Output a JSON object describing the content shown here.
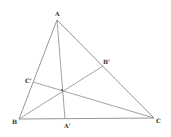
{
  "diagram": {
    "type": "triangle-cevians",
    "points": {
      "A": {
        "label": "A",
        "x": 57,
        "y": 20,
        "lx": 55,
        "ly": 16
      },
      "B": {
        "label": "B",
        "x": 19,
        "y": 119,
        "lx": 12,
        "ly": 124
      },
      "C": {
        "label": "C",
        "x": 154,
        "y": 118,
        "lx": 156,
        "ly": 123
      },
      "A1": {
        "label": "A'",
        "x": 65,
        "y": 119,
        "lx": 64,
        "ly": 128
      },
      "B1": {
        "label": "B'",
        "x": 103,
        "y": 66,
        "lx": 103,
        "ly": 64
      },
      "C1": {
        "label": "C'",
        "x": 33,
        "y": 82,
        "lx": 25,
        "ly": 83
      }
    },
    "concurrency_point": {
      "x": 62,
      "y": 90
    },
    "edges": [
      [
        "A",
        "B"
      ],
      [
        "B",
        "C"
      ],
      [
        "C",
        "A"
      ]
    ],
    "cevians": [
      [
        "A",
        "A1"
      ],
      [
        "B",
        "B1"
      ],
      [
        "C",
        "C1"
      ]
    ],
    "stroke_color": "#8a8a8a"
  }
}
